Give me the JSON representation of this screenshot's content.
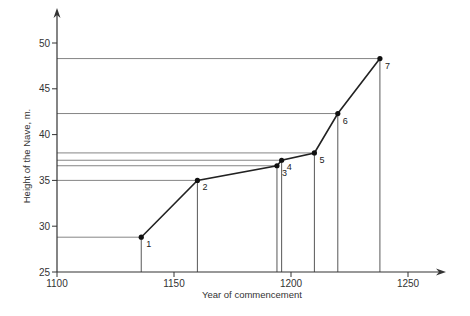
{
  "chart_data": {
    "type": "line",
    "title": "",
    "xlabel": "Year of commencement",
    "ylabel": "Height of the Nave, m.",
    "xlim": [
      1100,
      1270
    ],
    "ylim": [
      25,
      53
    ],
    "xticks": [
      1100,
      1150,
      1200,
      1250
    ],
    "yticks": [
      25,
      30,
      35,
      40,
      45,
      50
    ],
    "grid": false,
    "legend": null,
    "annotations": "Each point has horizontal and vertical reference lines dropped to the axes",
    "points": [
      {
        "label": "1",
        "x": 1136,
        "y": 28.8
      },
      {
        "label": "2",
        "x": 1160,
        "y": 35.0
      },
      {
        "label": "3",
        "x": 1194,
        "y": 36.6
      },
      {
        "label": "4",
        "x": 1196,
        "y": 37.2
      },
      {
        "label": "5",
        "x": 1210,
        "y": 38.0
      },
      {
        "label": "6",
        "x": 1220,
        "y": 42.3
      },
      {
        "label": "7",
        "x": 1238,
        "y": 48.3
      }
    ],
    "x": [
      1136,
      1160,
      1194,
      1196,
      1210,
      1220,
      1238
    ],
    "values": [
      28.8,
      35.0,
      36.6,
      37.2,
      38.0,
      42.3,
      48.3
    ]
  },
  "axes": {
    "xlabel": "Year of commencement",
    "ylabel": "Height of the Nave, m.",
    "xtick_labels": [
      "1100",
      "1150",
      "1200",
      "1250"
    ],
    "ytick_labels": [
      "25",
      "30",
      "35",
      "40",
      "45",
      "50"
    ]
  },
  "colors": {
    "line": "#222222",
    "ref": "#555555",
    "text": "#333333"
  }
}
